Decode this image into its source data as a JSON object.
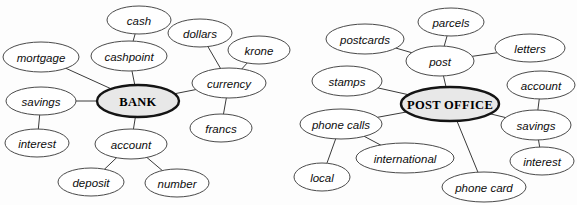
{
  "diagram": {
    "type": "word-web",
    "background_color": "#fdfdfd",
    "node_fill": "#ffffff",
    "node_stroke": "#4a4a4a",
    "central_node_fill": "#e8e8e8",
    "central_node_stroke": "#141414",
    "edge_color": "#3a3a3a",
    "label_color": "#0d0d0d"
  },
  "clusters": [
    {
      "id": "bank",
      "center_label": "BANK",
      "nodes": [
        {
          "id": "bank",
          "label": "BANK",
          "cx": 138,
          "cy": 101,
          "rx": 41,
          "ry": 16,
          "central": true
        },
        {
          "id": "cash",
          "label": "cash",
          "cx": 139,
          "cy": 20,
          "rx": 32,
          "ry": 14,
          "central": false
        },
        {
          "id": "cashpoint",
          "label": "cashpoint",
          "cx": 129,
          "cy": 56,
          "rx": 38,
          "ry": 15,
          "central": false
        },
        {
          "id": "mortgage",
          "label": "mortgage",
          "cx": 41,
          "cy": 57,
          "rx": 38,
          "ry": 15,
          "central": false
        },
        {
          "id": "savings",
          "label": "savings",
          "cx": 41,
          "cy": 101,
          "rx": 35,
          "ry": 14,
          "central": false
        },
        {
          "id": "interest",
          "label": "interest",
          "cx": 37,
          "cy": 143,
          "rx": 32,
          "ry": 14,
          "central": false
        },
        {
          "id": "account",
          "label": "account",
          "cx": 131,
          "cy": 144,
          "rx": 36,
          "ry": 15,
          "central": false
        },
        {
          "id": "deposit",
          "label": "deposit",
          "cx": 91,
          "cy": 182,
          "rx": 33,
          "ry": 14,
          "central": false
        },
        {
          "id": "number",
          "label": "number",
          "cx": 177,
          "cy": 183,
          "rx": 32,
          "ry": 14,
          "central": false
        },
        {
          "id": "currency",
          "label": "currency",
          "cx": 229,
          "cy": 83,
          "rx": 37,
          "ry": 15,
          "central": false
        },
        {
          "id": "dollars",
          "label": "dollars",
          "cx": 200,
          "cy": 33,
          "rx": 32,
          "ry": 14,
          "central": false
        },
        {
          "id": "krone",
          "label": "krone",
          "cx": 259,
          "cy": 50,
          "rx": 31,
          "ry": 14,
          "central": false
        },
        {
          "id": "francs",
          "label": "francs",
          "cx": 221,
          "cy": 128,
          "rx": 31,
          "ry": 14,
          "central": false
        }
      ],
      "edges": [
        {
          "from": "cash",
          "to": "cashpoint"
        },
        {
          "from": "cashpoint",
          "to": "bank"
        },
        {
          "from": "mortgage",
          "to": "bank"
        },
        {
          "from": "savings",
          "to": "bank"
        },
        {
          "from": "savings",
          "to": "interest"
        },
        {
          "from": "bank",
          "to": "account"
        },
        {
          "from": "account",
          "to": "deposit"
        },
        {
          "from": "account",
          "to": "number"
        },
        {
          "from": "bank",
          "to": "currency"
        },
        {
          "from": "dollars",
          "to": "currency"
        },
        {
          "from": "krone",
          "to": "currency"
        },
        {
          "from": "currency",
          "to": "francs"
        }
      ]
    },
    {
      "id": "post-office",
      "center_label": "POST OFFICE",
      "nodes": [
        {
          "id": "postoffice",
          "label": "POST OFFICE",
          "cx": 450,
          "cy": 104,
          "rx": 49,
          "ry": 17,
          "central": true
        },
        {
          "id": "parcels",
          "label": "parcels",
          "cx": 451,
          "cy": 22,
          "rx": 33,
          "ry": 14,
          "central": false
        },
        {
          "id": "post",
          "label": "post",
          "cx": 440,
          "cy": 61,
          "rx": 34,
          "ry": 15,
          "central": false
        },
        {
          "id": "postcards",
          "label": "postcards",
          "cx": 365,
          "cy": 39,
          "rx": 39,
          "ry": 15,
          "central": false
        },
        {
          "id": "letters",
          "label": "letters",
          "cx": 530,
          "cy": 48,
          "rx": 35,
          "ry": 14,
          "central": false
        },
        {
          "id": "stamps",
          "label": "stamps",
          "cx": 347,
          "cy": 81,
          "rx": 35,
          "ry": 15,
          "central": false
        },
        {
          "id": "phonecalls",
          "label": "phone calls",
          "cx": 341,
          "cy": 124,
          "rx": 41,
          "ry": 15,
          "central": false
        },
        {
          "id": "local",
          "label": "local",
          "cx": 322,
          "cy": 177,
          "rx": 28,
          "ry": 14,
          "central": false
        },
        {
          "id": "international",
          "label": "international",
          "cx": 405,
          "cy": 158,
          "rx": 49,
          "ry": 15,
          "central": false
        },
        {
          "id": "phonecard",
          "label": "phone card",
          "cx": 484,
          "cy": 187,
          "rx": 42,
          "ry": 15,
          "central": false
        },
        {
          "id": "account",
          "label": "account",
          "cx": 541,
          "cy": 85,
          "rx": 34,
          "ry": 14,
          "central": false
        },
        {
          "id": "savings",
          "label": "savings",
          "cx": 536,
          "cy": 125,
          "rx": 35,
          "ry": 15,
          "central": false
        },
        {
          "id": "interest",
          "label": "interest",
          "cx": 542,
          "cy": 161,
          "rx": 32,
          "ry": 14,
          "central": false
        }
      ],
      "edges": [
        {
          "from": "parcels",
          "to": "post"
        },
        {
          "from": "postcards",
          "to": "post"
        },
        {
          "from": "post",
          "to": "letters"
        },
        {
          "from": "post",
          "to": "postoffice"
        },
        {
          "from": "stamps",
          "to": "postoffice"
        },
        {
          "from": "phonecalls",
          "to": "postoffice"
        },
        {
          "from": "phonecalls",
          "to": "local"
        },
        {
          "from": "phonecalls",
          "to": "international"
        },
        {
          "from": "postoffice",
          "to": "phonecard"
        },
        {
          "from": "postoffice",
          "to": "savings"
        },
        {
          "from": "account",
          "to": "savings"
        },
        {
          "from": "savings",
          "to": "interest"
        }
      ]
    }
  ]
}
